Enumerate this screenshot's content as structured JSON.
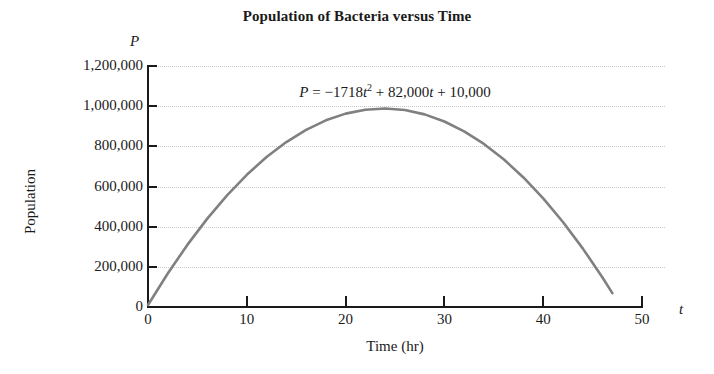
{
  "chart_data": {
    "type": "line",
    "title": "Population of Bacteria versus Time",
    "xlabel": "Time (hr)",
    "ylabel": "Population",
    "x_symbol": "t",
    "y_symbol": "P",
    "equation_text": "P = −1718t² + 82,000t + 10,000",
    "equation_parts": {
      "lhs": "P",
      "eq": "=",
      "minus": "−",
      "a_coeff": "1718",
      "var1": "t",
      "power": "2",
      "plus1": "+",
      "b_coeff": "82,000",
      "var2": "t",
      "plus2": "+",
      "c_coeff": "10,000"
    },
    "xlim": [
      0,
      50
    ],
    "ylim": [
      0,
      1200000
    ],
    "xticks": [
      0,
      10,
      20,
      30,
      40,
      50
    ],
    "xtick_labels": [
      "0",
      "10",
      "20",
      "30",
      "40",
      "50"
    ],
    "yticks": [
      0,
      200000,
      400000,
      600000,
      800000,
      1000000,
      1200000
    ],
    "ytick_labels": [
      "0",
      "200,000",
      "400,000",
      "600,000",
      "800,000",
      "1,000,000",
      "1,200,000"
    ],
    "grid": "horizontal-dotted",
    "legend": "none",
    "curve_color": "#808080",
    "axis_color": "#1a1a1a",
    "grid_color": "#c9c9c9",
    "background": "#ffffff",
    "domain_drawn": [
      0,
      47
    ],
    "vertex": {
      "x": 23.86,
      "y": 989598
    },
    "x": [
      0,
      2,
      4,
      6,
      8,
      10,
      12,
      14,
      16,
      18,
      20,
      22,
      24,
      26,
      28,
      30,
      32,
      34,
      36,
      38,
      40,
      42,
      44,
      46,
      47
    ],
    "values": [
      10000,
      167128,
      310512,
      440152,
      556048,
      658200,
      746608,
      821272,
      882192,
      929368,
      962800,
      982488,
      988432,
      980632,
      959088,
      923800,
      874768,
      811992,
      735472,
      645208,
      541200,
      423448,
      291952,
      146712,
      69038
    ]
  }
}
